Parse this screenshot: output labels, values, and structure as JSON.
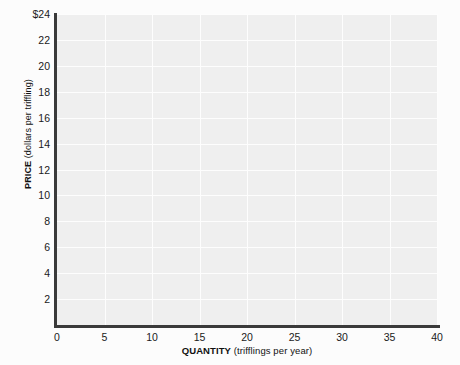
{
  "chart_data": {
    "type": "line",
    "title": "",
    "xlabel_name": "QUANTITY",
    "xlabel_units": "(trifflings per year)",
    "ylabel_name": "PRICE",
    "ylabel_units": "(dollars per triffling)",
    "xlim": [
      0,
      40
    ],
    "ylim": [
      0,
      24
    ],
    "x_ticks": [
      0,
      5,
      10,
      15,
      20,
      25,
      30,
      35,
      40
    ],
    "x_tick_labels": [
      "0",
      "5",
      "10",
      "15",
      "20",
      "25",
      "30",
      "35",
      "40"
    ],
    "y_ticks": [
      2,
      4,
      6,
      8,
      10,
      12,
      14,
      16,
      18,
      20,
      22,
      24
    ],
    "y_tick_labels": [
      "2",
      "4",
      "6",
      "8",
      "10",
      "12",
      "14",
      "16",
      "18",
      "20",
      "22",
      "$24"
    ],
    "grid": true,
    "legend": "none",
    "series": [],
    "annotations": [],
    "plot_background_color": "#efefef",
    "gridline_color": "#fdfdfd",
    "axis_color": "#3a3a3a",
    "page_background_color": "#fcfcfc"
  }
}
